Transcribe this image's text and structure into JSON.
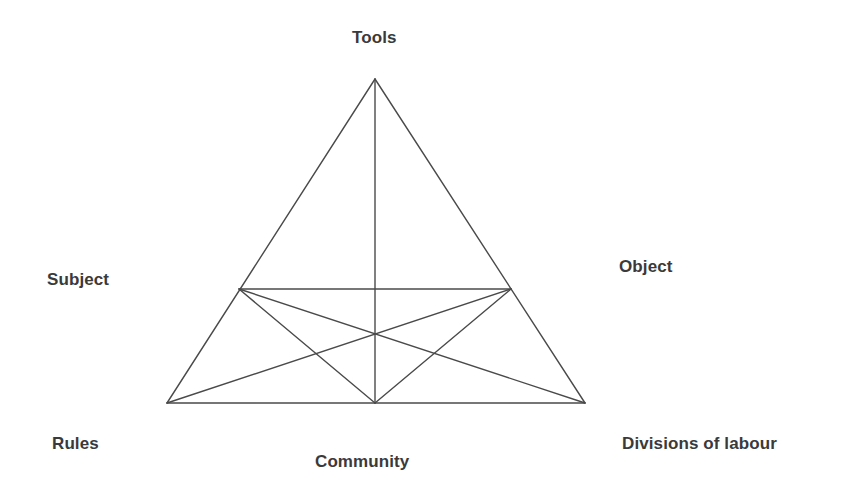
{
  "diagram": {
    "type": "activity-system-triangle",
    "background_color": "#ffffff",
    "stroke_color": "#4a4a4a",
    "label_color": "#3a3a3a",
    "stroke_width": 1.4,
    "nodes": [
      {
        "id": "tools",
        "label": "Tools",
        "x": 375,
        "y": 79
      },
      {
        "id": "subject",
        "label": "Subject",
        "x": 239,
        "y": 289
      },
      {
        "id": "object",
        "label": "Object",
        "x": 511,
        "y": 289
      },
      {
        "id": "rules",
        "label": "Rules",
        "x": 167,
        "y": 403
      },
      {
        "id": "community",
        "label": "Community",
        "x": 375,
        "y": 403
      },
      {
        "id": "division",
        "label": "Divisions of labour",
        "x": 585,
        "y": 403
      }
    ],
    "edges": [
      {
        "from": "tools",
        "to": "rules"
      },
      {
        "from": "tools",
        "to": "division"
      },
      {
        "from": "tools",
        "to": "community"
      },
      {
        "from": "rules",
        "to": "division"
      },
      {
        "from": "subject",
        "to": "object"
      },
      {
        "from": "subject",
        "to": "community"
      },
      {
        "from": "object",
        "to": "community"
      },
      {
        "from": "subject",
        "to": "division"
      },
      {
        "from": "object",
        "to": "rules"
      }
    ],
    "labels": {
      "tools": "Tools",
      "subject": "Subject",
      "object": "Object",
      "rules": "Rules",
      "community": "Community",
      "division": "Divisions of labour"
    }
  }
}
